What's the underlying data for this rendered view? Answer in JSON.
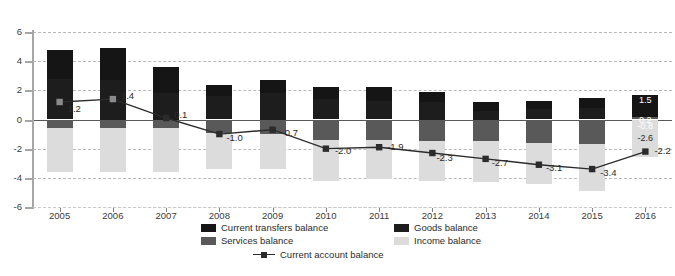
{
  "chart_data": {
    "type": "bar",
    "subtype": "stacked-bar-with-line",
    "title": "",
    "xlabel": "",
    "ylabel": "",
    "ylim": [
      -6,
      6
    ],
    "yticks": [
      6,
      4,
      2,
      0,
      -2,
      -4,
      -6
    ],
    "ytick_labels": [
      "6",
      "4",
      "2",
      "0",
      "-2",
      "-4",
      "-6"
    ],
    "grid": true,
    "legend_position": "bottom",
    "categories": [
      "2005",
      "2006",
      "2007",
      "2008",
      "2009",
      "2010",
      "2011",
      "2012",
      "2013",
      "2014",
      "2015",
      "2016"
    ],
    "series": [
      {
        "name": "Current transfers balance",
        "color": "#151515",
        "values": [
          2.0,
          2.2,
          1.8,
          0.8,
          0.9,
          0.8,
          0.9,
          0.7,
          0.6,
          0.6,
          0.7,
          1.5
        ]
      },
      {
        "name": "Goods balance",
        "color": "#1d1d1d",
        "values": [
          2.8,
          2.7,
          1.8,
          1.6,
          1.8,
          1.4,
          1.3,
          1.2,
          0.6,
          0.7,
          0.8,
          0.0
        ]
      },
      {
        "name": "Services balance",
        "color": "#595959",
        "values": [
          -0.6,
          -0.6,
          -0.6,
          -0.9,
          -1.0,
          -1.4,
          -1.4,
          -1.5,
          -1.5,
          -1.6,
          -1.7,
          0.2
        ]
      },
      {
        "name": "Income balance",
        "color": "#dcdcdc",
        "values": [
          -3.0,
          -3.0,
          -3.0,
          -2.5,
          -2.4,
          -2.8,
          -2.7,
          -2.7,
          -2.8,
          -2.8,
          -3.2,
          -2.6
        ]
      }
    ],
    "line_series": {
      "name": "Current account balance",
      "color": "#2b2b2b",
      "marker": "square",
      "values": [
        1.2,
        1.4,
        0.1,
        -1.0,
        -0.7,
        -2.0,
        -1.9,
        -2.3,
        -2.7,
        -3.1,
        -3.4,
        -2.2
      ],
      "labels": [
        "1.2",
        "1.4",
        "0.1",
        "-1.0",
        "-0.7",
        "-2.0",
        "-1.9",
        "-2.3",
        "-2.7",
        "-3.1",
        "-3.4",
        "-2.2"
      ]
    },
    "labeled_bar": {
      "category": "2016",
      "labels": [
        "1.5",
        "0.2",
        "-0.8",
        "-2.6"
      ]
    }
  },
  "legend": {
    "items": [
      {
        "label": "Current transfers balance",
        "color": "#151515",
        "type": "swatch"
      },
      {
        "label": "Goods balance",
        "color": "#1d1d1d",
        "type": "swatch"
      },
      {
        "label": "Services balance",
        "color": "#595959",
        "type": "swatch"
      },
      {
        "label": "Income balance",
        "color": "#dcdcdc",
        "type": "swatch"
      },
      {
        "label": "Current account balance",
        "color": "#2b2b2b",
        "type": "line"
      }
    ]
  }
}
